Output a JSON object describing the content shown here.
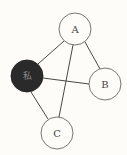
{
  "diagram": {
    "type": "graph",
    "nodes": [
      {
        "id": "A",
        "label": "A",
        "x": 75,
        "y": 29,
        "r": 16,
        "style": "light"
      },
      {
        "id": "B",
        "label": "B",
        "x": 105,
        "y": 84,
        "r": 16,
        "style": "light"
      },
      {
        "id": "me",
        "label": "私",
        "x": 27,
        "y": 76,
        "r": 16,
        "style": "dark"
      },
      {
        "id": "C",
        "label": "C",
        "x": 57,
        "y": 133,
        "r": 16,
        "style": "light"
      }
    ],
    "edges": [
      {
        "from": "me",
        "to": "A"
      },
      {
        "from": "me",
        "to": "B"
      },
      {
        "from": "me",
        "to": "C"
      },
      {
        "from": "A",
        "to": "B"
      },
      {
        "from": "A",
        "to": "C"
      }
    ]
  }
}
